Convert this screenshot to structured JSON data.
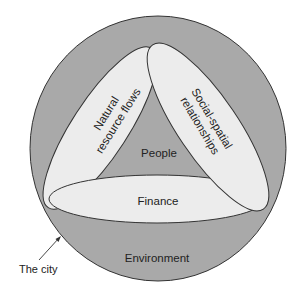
{
  "diagram": {
    "outer_circle_label": "Environment",
    "pointer_label": "The city",
    "center_label": "People",
    "ellipses": {
      "left": {
        "line1": "Natural",
        "line2": "resource flows"
      },
      "right": {
        "line1": "Social-spatial",
        "line2": "relationships"
      },
      "bottom": {
        "label": "Finance"
      }
    }
  },
  "colors": {
    "outer_fill": "#a9a9a9",
    "ellipse_fill": "#ececec",
    "stroke": "#333333",
    "background": "#ffffff"
  }
}
